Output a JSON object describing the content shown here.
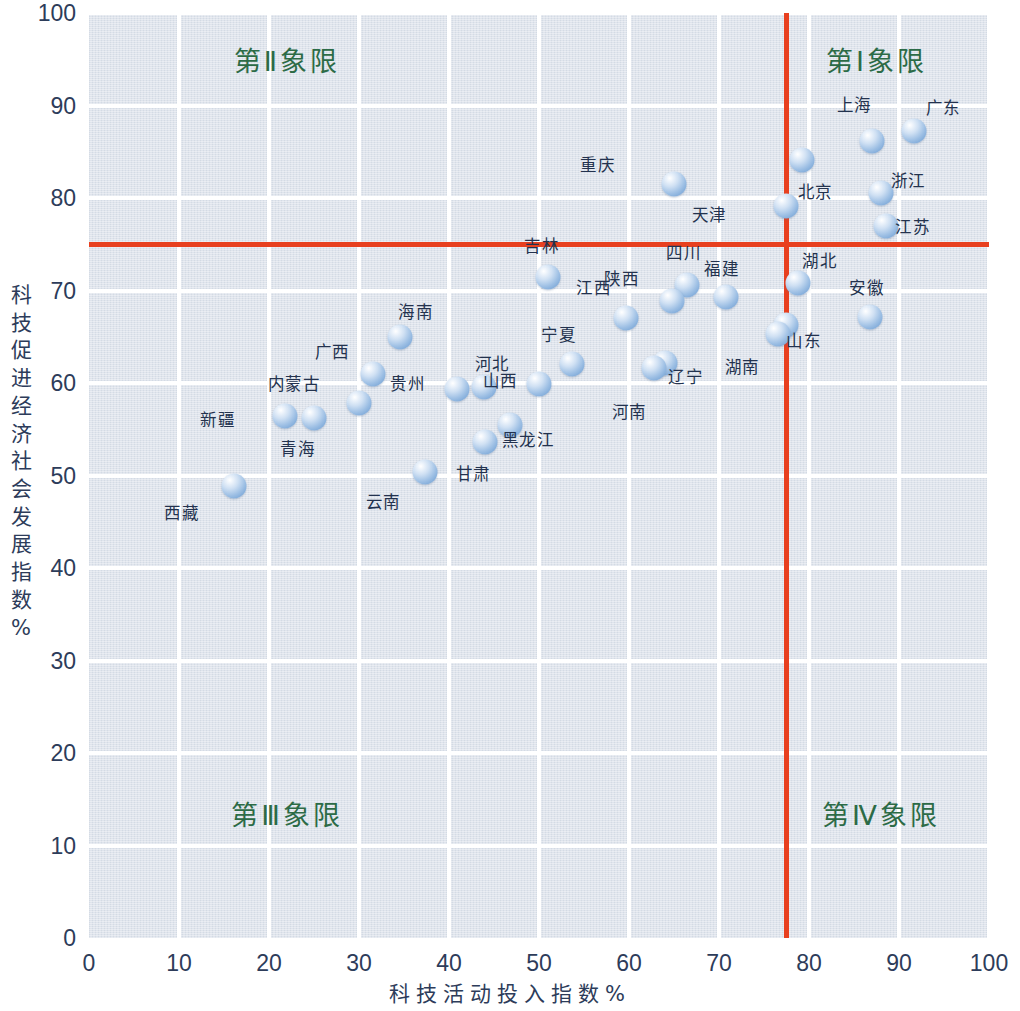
{
  "chart_data": {
    "type": "scatter",
    "title": "",
    "xlabel": "科技活动投入指数%",
    "ylabel": "科技促进经济社会发展指数 %",
    "xlim": [
      0,
      100
    ],
    "ylim": [
      0,
      100
    ],
    "xticks": [
      "0",
      "10",
      "20",
      "30",
      "40",
      "50",
      "60",
      "70",
      "80",
      "90",
      "100"
    ],
    "yticks": [
      "0",
      "10",
      "20",
      "30",
      "40",
      "50",
      "60",
      "70",
      "80",
      "90",
      "100"
    ],
    "grid": true,
    "legend": "none",
    "reference_lines": {
      "vertical_x": 77.4,
      "horizontal_y": 75.0,
      "color": "#e8401f"
    },
    "quadrant_labels": [
      {
        "id": "q1",
        "text": "第Ⅰ象限",
        "x": 87.5,
        "y": 95.0
      },
      {
        "id": "q2",
        "text": "第Ⅱ象限",
        "x": 22.0,
        "y": 95.0
      },
      {
        "id": "q3",
        "text": "第Ⅲ象限",
        "x": 22.0,
        "y": 13.5
      },
      {
        "id": "q4",
        "text": "第Ⅳ象限",
        "x": 88.0,
        "y": 13.5
      }
    ],
    "point_color": "#8fb6df",
    "points": [
      {
        "name": "广东",
        "x": 91.7,
        "y": 87.2,
        "lx": 3.2,
        "ly": 2.6
      },
      {
        "name": "上海",
        "x": 87.0,
        "y": 86.2,
        "lx": -2.0,
        "ly": 4.0
      },
      {
        "name": "北京",
        "x": 79.2,
        "y": 84.1,
        "lx": 1.5,
        "ly": -3.3
      },
      {
        "name": "重庆",
        "x": 65.0,
        "y": 81.5,
        "lx": -8.5,
        "ly": 2.2
      },
      {
        "name": "浙江",
        "x": 88.0,
        "y": 80.5,
        "lx": 3.0,
        "ly": 1.4
      },
      {
        "name": "天津",
        "x": 77.4,
        "y": 79.1,
        "lx": -8.5,
        "ly": -0.8
      },
      {
        "name": "江苏",
        "x": 88.5,
        "y": 77.0,
        "lx": 3.0,
        "ly": 0.0
      },
      {
        "name": "吉林",
        "x": 51.0,
        "y": 71.5,
        "lx": -0.7,
        "ly": 3.4
      },
      {
        "name": "四川",
        "x": 66.4,
        "y": 70.6,
        "lx": -0.3,
        "ly": 3.6
      },
      {
        "name": "湖北",
        "x": 78.8,
        "y": 70.8,
        "lx": 2.4,
        "ly": 2.5
      },
      {
        "name": "福建",
        "x": 70.8,
        "y": 69.3,
        "lx": -0.5,
        "ly": 3.1
      },
      {
        "name": "陕西",
        "x": 64.8,
        "y": 68.9,
        "lx": -5.6,
        "ly": 2.4
      },
      {
        "name": "江西",
        "x": 59.7,
        "y": 67.0,
        "lx": -3.6,
        "ly": 3.4
      },
      {
        "name": "安徽",
        "x": 86.8,
        "y": 67.1,
        "lx": -0.4,
        "ly": 3.3
      },
      {
        "name": "山东",
        "x": 77.4,
        "y": 66.3,
        "lx": 2.0,
        "ly": -1.6
      },
      {
        "name": "海南",
        "x": 34.6,
        "y": 65.0,
        "lx": 1.7,
        "ly": 2.8
      },
      {
        "name": "辽宁",
        "x": 64.0,
        "y": 62.2,
        "lx": 2.3,
        "ly": -1.4
      },
      {
        "name": "河南",
        "x": 62.8,
        "y": 61.6,
        "lx": -2.8,
        "ly": -4.6
      },
      {
        "name": "宁夏",
        "x": 53.7,
        "y": 62.1,
        "lx": -1.5,
        "ly": 3.2
      },
      {
        "name": "广西",
        "x": 31.5,
        "y": 61.0,
        "lx": -4.5,
        "ly": 2.5
      },
      {
        "name": "湖南",
        "x": 76.6,
        "y": 65.3,
        "lx": -4.0,
        "ly": -3.5
      },
      {
        "name": "河北",
        "x": 50.0,
        "y": 59.9,
        "lx": -5.2,
        "ly": 2.3
      },
      {
        "name": "山西",
        "x": 43.9,
        "y": 59.6,
        "lx": 1.8,
        "ly": 0.7
      },
      {
        "name": "贵州",
        "x": 40.9,
        "y": 59.3,
        "lx": -5.5,
        "ly": 0.7
      },
      {
        "name": "内蒙古",
        "x": 30.0,
        "y": 57.8,
        "lx": -7.2,
        "ly": 2.2
      },
      {
        "name": "青海",
        "x": 25.0,
        "y": 56.2,
        "lx": -1.8,
        "ly": -3.2
      },
      {
        "name": "新疆",
        "x": 21.8,
        "y": 56.4,
        "lx": -7.5,
        "ly": -0.3
      },
      {
        "name": "黑龙江",
        "x": 46.8,
        "y": 55.5,
        "lx": 2.0,
        "ly": -1.5
      },
      {
        "name": "甘肃",
        "x": 44.0,
        "y": 53.6,
        "lx": -1.3,
        "ly": -3.3
      },
      {
        "name": "云南",
        "x": 37.3,
        "y": 50.4,
        "lx": -4.6,
        "ly": -3.2
      },
      {
        "name": "西藏",
        "x": 16.1,
        "y": 48.9,
        "lx": -5.8,
        "ly": -2.8
      }
    ]
  }
}
